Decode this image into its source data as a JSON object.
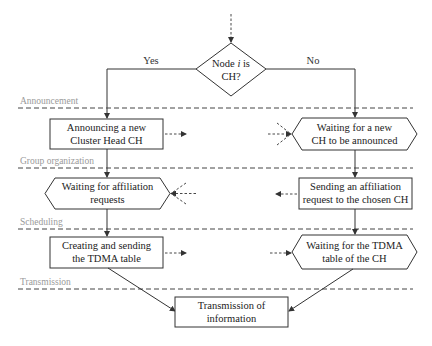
{
  "decision": {
    "line1_prefix": "Node ",
    "line1_var": "i",
    "line1_suffix": " is",
    "line2": "CH?"
  },
  "branches": {
    "yes": "Yes",
    "no": "No"
  },
  "phases": [
    {
      "label": "Announcement"
    },
    {
      "label": "Group organization"
    },
    {
      "label": "Scheduling"
    },
    {
      "label": "Transmission"
    }
  ],
  "left_column": {
    "announce": {
      "line1": "Announcing a new",
      "line2": "Cluster Head CH"
    },
    "wait_affiliation": {
      "line1": "Waiting for affiliation",
      "line2": "requests"
    },
    "create_tdma": {
      "line1": "Creating and sending",
      "line2": "the TDMA table"
    }
  },
  "right_column": {
    "wait_ch": {
      "line1": "Waiting for a new",
      "line2": "CH to be announced"
    },
    "send_affiliation": {
      "line1": "Sending an affiliation",
      "line2": "request to the chosen CH"
    },
    "wait_tdma": {
      "line1": "Waiting for the TDMA",
      "line2": "table of the CH"
    }
  },
  "final": {
    "line1": "Transmission of",
    "line2": "information"
  },
  "colors": {
    "stroke": "#333333",
    "phase_line": "#444444",
    "phase_text": "#9a9a9a"
  }
}
